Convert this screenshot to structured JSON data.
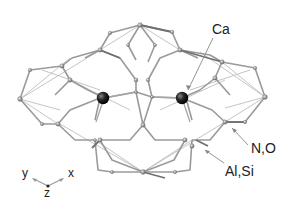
{
  "figure": {
    "type": "crystal-structure-cage",
    "labels": {
      "ca": "Ca",
      "n_o": "N,O",
      "al_si": "Al,Si"
    },
    "axes": {
      "y": "y",
      "x": "x",
      "z": "z"
    },
    "colors": {
      "framework_bond": "#9a9a9a",
      "dark_bond": "#777777",
      "framework_atom": "#8c8c8c",
      "ca_atom": "#1a1a1a",
      "leader_line": "#888888",
      "text": "#222222"
    }
  }
}
